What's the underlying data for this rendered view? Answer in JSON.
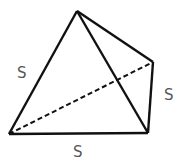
{
  "diagram": {
    "type": "tetrahedron",
    "vertices": {
      "apex": [
        77,
        11
      ],
      "back_right": [
        153,
        62
      ],
      "front_right": [
        148,
        133
      ],
      "front_left": [
        9,
        134
      ]
    },
    "edges": [
      {
        "from": "apex",
        "to": "front_left",
        "style": "solid"
      },
      {
        "from": "apex",
        "to": "front_right",
        "style": "solid"
      },
      {
        "from": "apex",
        "to": "back_right",
        "style": "solid"
      },
      {
        "from": "back_right",
        "to": "front_right",
        "style": "solid"
      },
      {
        "from": "front_left",
        "to": "front_right",
        "style": "solid"
      },
      {
        "from": "front_left",
        "to": "back_right",
        "style": "dashed"
      }
    ],
    "labels": {
      "left_edge": "S",
      "right_edge": "S",
      "bottom_edge": "S"
    },
    "colors": {
      "stroke": "#111111",
      "label": "#555555",
      "background": "#ffffff"
    }
  }
}
